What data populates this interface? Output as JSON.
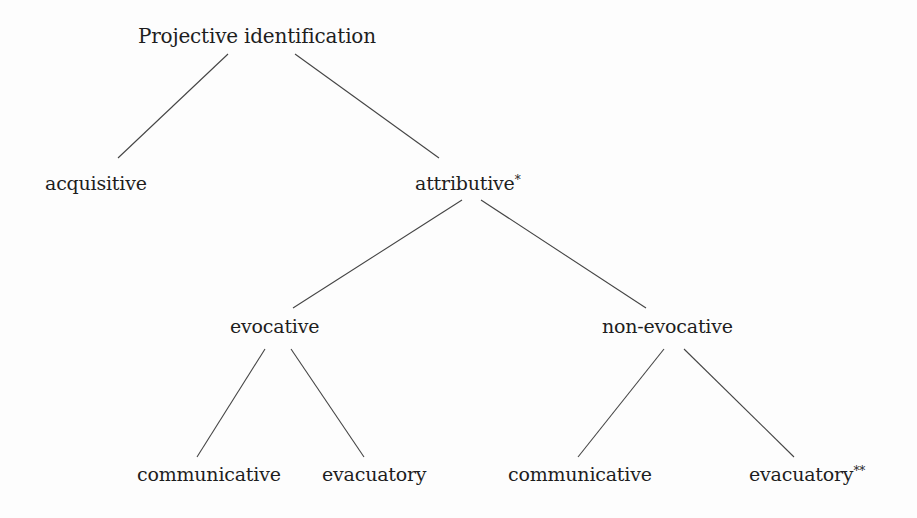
{
  "diagram": {
    "type": "tree",
    "root": {
      "id": "projective-identification",
      "label": "Projective identification",
      "children": [
        {
          "id": "acquisitive",
          "label": "acquisitive"
        },
        {
          "id": "attributive",
          "label": "attributive",
          "mark": "*",
          "children": [
            {
              "id": "evocative",
              "label": "evocative",
              "children": [
                {
                  "id": "evocative-communicative",
                  "label": "communicative"
                },
                {
                  "id": "evocative-evacuatory",
                  "label": "evacuatory"
                }
              ]
            },
            {
              "id": "non-evocative",
              "label": "non-evocative",
              "children": [
                {
                  "id": "non-evocative-communicative",
                  "label": "communicative"
                },
                {
                  "id": "non-evocative-evacuatory",
                  "label": "evacuatory",
                  "mark": "**"
                }
              ]
            }
          ]
        }
      ]
    }
  },
  "nodes": {
    "root": {
      "label": "Projective identification"
    },
    "acquisitive": {
      "label": "acquisitive"
    },
    "attributive": {
      "label": "attributive",
      "mark": "*"
    },
    "evocative": {
      "label": "evocative"
    },
    "non_evocative": {
      "label": "non-evocative"
    },
    "evocative_communicative": {
      "label": "communicative"
    },
    "evocative_evacuatory": {
      "label": "evacuatory"
    },
    "non_evocative_communicative": {
      "label": "communicative"
    },
    "non_evocative_evacuatory": {
      "label": "evacuatory",
      "mark": "**"
    }
  },
  "edges": [
    {
      "from": "root",
      "to": "acquisitive"
    },
    {
      "from": "root",
      "to": "attributive"
    },
    {
      "from": "attributive",
      "to": "evocative"
    },
    {
      "from": "attributive",
      "to": "non_evocative"
    },
    {
      "from": "evocative",
      "to": "evocative_communicative"
    },
    {
      "from": "evocative",
      "to": "evocative_evacuatory"
    },
    {
      "from": "non_evocative",
      "to": "non_evocative_communicative"
    },
    {
      "from": "non_evocative",
      "to": "non_evocative_evacuatory"
    }
  ],
  "colors": {
    "text": "#1e1e1e",
    "line": "#444444",
    "background": "#fdfdfd"
  }
}
